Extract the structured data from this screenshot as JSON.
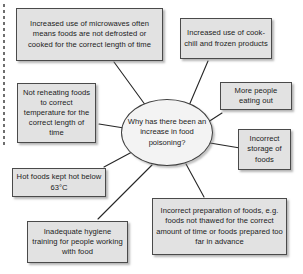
{
  "diagram": {
    "type": "spider-mind-map",
    "title": "Why has there been an increase in food poisoning?",
    "center": {
      "id": "center-question",
      "text": "Why has there been an increase in food poisoning?",
      "shape": "ellipse"
    },
    "nodes": [
      {
        "id": "node-microwaves",
        "text": "Increased use of microwaves often means foods are not defrosted or cooked for the correct length of time",
        "position": "top-left"
      },
      {
        "id": "node-cookchill",
        "text": "Increased use of cook-chill and frozen products",
        "position": "top-right"
      },
      {
        "id": "node-reheating",
        "text": "Not reheating foods to correct temperature for the correct length of time",
        "position": "left-upper"
      },
      {
        "id": "node-eatingout",
        "text": "More people eating out",
        "position": "right-upper"
      },
      {
        "id": "node-storage",
        "text": "Incorrect storage of foods",
        "position": "right-lower"
      },
      {
        "id": "node-hotfoods",
        "text": "Hot foods kept hot below 63°C",
        "position": "left-lower"
      },
      {
        "id": "node-hygiene",
        "text": "Inadequate hygiene training for people working with food",
        "position": "bottom-left"
      },
      {
        "id": "node-preparation",
        "text": "Incorrect preparation of foods, e.g. foods not thawed for the correct amount of time or foods prepared too far in advance",
        "position": "bottom-right"
      }
    ],
    "colors": {
      "box_fill": "#e2e2e2",
      "box_border": "#4a4a4a",
      "center_fill": "#f3f3f3",
      "center_border": "#3e3e3e",
      "connector": "#262626",
      "text": "#1b1b1b",
      "margin_rule": "#6e6e6e",
      "background": "#ffffff"
    }
  }
}
